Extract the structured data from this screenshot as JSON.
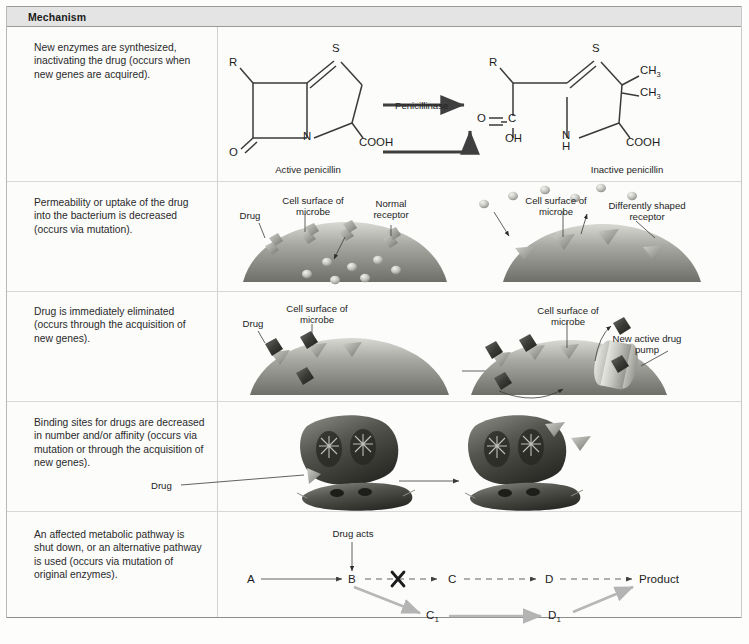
{
  "figure": {
    "header": {
      "label": "Mechanism"
    },
    "rows": [
      {
        "id": "enzyme-inactivation",
        "mechanism_text": "New enzymes are synthesized, inactivating the drug (occurs when new genes are acquired).",
        "labels": {
          "left_caption": "Active penicillin",
          "right_caption": "Inactive penicillin",
          "enzyme": "Penicillinase",
          "atoms_left": [
            "R",
            "S",
            "N",
            "O",
            "COOH"
          ],
          "atoms_right": [
            "R",
            "S",
            "CH3",
            "CH3",
            "N",
            "H",
            "O",
            "C",
            "OH",
            "COOH"
          ]
        }
      },
      {
        "id": "decreased-permeability",
        "mechanism_text": "Permeability or uptake of the drug into the bacterium is decreased (occurs via mutation).",
        "labels": {
          "drug": "Drug",
          "cell_surface": "Cell surface of microbe",
          "normal_receptor": "Normal receptor",
          "cell_surface_right": "Cell surface of microbe",
          "altered_receptor": "Differently shaped receptor"
        }
      },
      {
        "id": "active-efflux",
        "mechanism_text": "Drug is immediately eliminated (occurs through the acquisition of new genes).",
        "labels": {
          "drug": "Drug",
          "cell_surface": "Cell surface of microbe",
          "cell_surface_right": "Cell surface of microbe",
          "pump": "New active drug pump"
        }
      },
      {
        "id": "target-modification",
        "mechanism_text": "Binding sites for drugs are decreased in number and/or affinity (occurs via mutation or through the acquisition of new genes).",
        "labels": {
          "drug": "Drug"
        }
      },
      {
        "id": "alternate-pathway",
        "mechanism_text": "An affected metabolic pathway is shut down, or an alternative pathway is used (occurs via mutation of original enzymes).",
        "labels": {
          "drug_acts": "Drug acts"
        },
        "pathway": {
          "main_nodes": [
            "A",
            "B",
            "C",
            "D",
            "Product"
          ],
          "alt_nodes": [
            "C",
            "D"
          ],
          "alt_subscript": "1"
        }
      }
    ],
    "colors": {
      "header_fill": "#e4e4e4",
      "rule": "#d8d8d8",
      "ink": "#3a3a3a",
      "alt_pathway": "#b4b4b4",
      "cell_fill": "#9b9b96"
    }
  }
}
